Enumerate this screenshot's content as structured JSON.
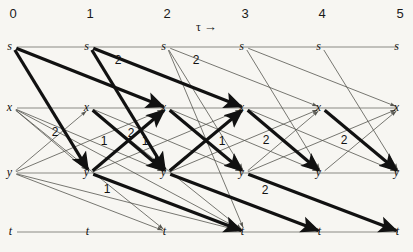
{
  "figure": {
    "kind": "trellis-diagram",
    "background": "#f7f6f2",
    "ink": "#111111",
    "thin_ink": "#55554f",
    "rail_ink": "#8a8a84",
    "width": 413,
    "height": 252
  },
  "axis": {
    "label": "τ",
    "arrow": "→",
    "ticks": [
      {
        "text": "0",
        "x": 13
      },
      {
        "text": "1",
        "x": 90
      },
      {
        "text": "2",
        "x": 167
      },
      {
        "text": "3",
        "x": 245
      },
      {
        "text": "4",
        "x": 322
      },
      {
        "text": "5",
        "x": 400
      }
    ],
    "tick_y": 14
  },
  "rows": [
    {
      "name": "s",
      "label": "s",
      "y": 47
    },
    {
      "name": "x",
      "label": "x",
      "y": 108
    },
    {
      "name": "y",
      "label": "y",
      "y": 173
    },
    {
      "name": "t",
      "label": "t",
      "y": 232
    }
  ],
  "columns": [
    13,
    90,
    167,
    245,
    322,
    400
  ],
  "nodes": [
    {
      "id": "s0",
      "row": "s",
      "col": 0,
      "label": "s"
    },
    {
      "id": "s1",
      "row": "s",
      "col": 1,
      "label": "s"
    },
    {
      "id": "s2",
      "row": "s",
      "col": 2,
      "label": "s"
    },
    {
      "id": "s3",
      "row": "s",
      "col": 3,
      "label": "s"
    },
    {
      "id": "s4",
      "row": "s",
      "col": 4,
      "label": "s"
    },
    {
      "id": "s5",
      "row": "s",
      "col": 5,
      "label": "s"
    },
    {
      "id": "x0",
      "row": "x",
      "col": 0,
      "label": "x"
    },
    {
      "id": "x1",
      "row": "x",
      "col": 1,
      "label": "x"
    },
    {
      "id": "x2",
      "row": "x",
      "col": 2,
      "label": "x"
    },
    {
      "id": "x3",
      "row": "x",
      "col": 3,
      "label": "x"
    },
    {
      "id": "x4",
      "row": "x",
      "col": 4,
      "label": "x"
    },
    {
      "id": "x5",
      "row": "x",
      "col": 5,
      "label": "x"
    },
    {
      "id": "y0",
      "row": "y",
      "col": 0,
      "label": "y"
    },
    {
      "id": "y1",
      "row": "y",
      "col": 1,
      "label": "y"
    },
    {
      "id": "y2",
      "row": "y",
      "col": 2,
      "label": "y"
    },
    {
      "id": "y3",
      "row": "y",
      "col": 3,
      "label": "y"
    },
    {
      "id": "y4",
      "row": "y",
      "col": 4,
      "label": "y"
    },
    {
      "id": "y5",
      "row": "y",
      "col": 5,
      "label": "y"
    },
    {
      "id": "t0",
      "row": "t",
      "col": 0,
      "label": "t"
    },
    {
      "id": "t1",
      "row": "t",
      "col": 1,
      "label": "t"
    },
    {
      "id": "t2",
      "row": "t",
      "col": 2,
      "label": "t"
    },
    {
      "id": "t3",
      "row": "t",
      "col": 3,
      "label": "t"
    },
    {
      "id": "t4",
      "row": "t",
      "col": 4,
      "label": "t"
    },
    {
      "id": "t5",
      "row": "t",
      "col": 5,
      "label": "t"
    }
  ],
  "rails": [
    {
      "row": "s",
      "from": 0,
      "to": 5
    },
    {
      "row": "x",
      "from": 0,
      "to": 5
    },
    {
      "row": "y",
      "from": 0,
      "to": 5
    },
    {
      "row": "t",
      "from": 0,
      "to": 5
    }
  ],
  "thin_edges": [
    {
      "from": "x0",
      "to": "y1"
    },
    {
      "from": "x0",
      "to": "y2"
    },
    {
      "from": "x0",
      "to": "t2"
    },
    {
      "from": "x0",
      "to": "t3"
    },
    {
      "from": "y0",
      "to": "x1"
    },
    {
      "from": "y0",
      "to": "x2"
    },
    {
      "from": "y0",
      "to": "t2"
    },
    {
      "from": "y0",
      "to": "t3"
    },
    {
      "from": "s1",
      "to": "y2"
    },
    {
      "from": "x1",
      "to": "y2"
    },
    {
      "from": "x1",
      "to": "y3"
    },
    {
      "from": "x1",
      "to": "t3"
    },
    {
      "from": "y1",
      "to": "x2"
    },
    {
      "from": "y1",
      "to": "x3"
    },
    {
      "from": "y1",
      "to": "t3"
    },
    {
      "from": "s2",
      "to": "y3"
    },
    {
      "from": "s2",
      "to": "x4"
    },
    {
      "from": "s2",
      "to": "t3"
    },
    {
      "from": "x2",
      "to": "y3"
    },
    {
      "from": "x2",
      "to": "y4"
    },
    {
      "from": "y2",
      "to": "x3"
    },
    {
      "from": "y2",
      "to": "x4"
    },
    {
      "from": "s3",
      "to": "y4"
    },
    {
      "from": "s3",
      "to": "x5"
    },
    {
      "from": "x3",
      "to": "y4"
    },
    {
      "from": "x3",
      "to": "y5"
    },
    {
      "from": "y3",
      "to": "x4"
    },
    {
      "from": "y3",
      "to": "x5"
    },
    {
      "from": "s4",
      "to": "y5"
    },
    {
      "from": "x4",
      "to": "y5"
    },
    {
      "from": "y4",
      "to": "x5"
    }
  ],
  "bold_edges": [
    {
      "from": "s0",
      "to": "y1",
      "label": "2",
      "label_x": 55,
      "label_y": 132
    },
    {
      "from": "s0",
      "to": "x2",
      "label": "2",
      "label_x": 118,
      "label_y": 60
    },
    {
      "from": "s1",
      "to": "y2",
      "label": "2",
      "label_x": 131,
      "label_y": 133
    },
    {
      "from": "s1",
      "to": "x3",
      "label": "2",
      "label_x": 196,
      "label_y": 60
    },
    {
      "from": "y1",
      "to": "x2",
      "label": "1",
      "label_x": 104,
      "label_y": 141
    },
    {
      "from": "x1",
      "to": "y2",
      "label": "1",
      "label_x": 145,
      "label_y": 141
    },
    {
      "from": "y1",
      "to": "t3",
      "label": "1",
      "label_x": 107,
      "label_y": 189
    },
    {
      "from": "x2",
      "to": "y3",
      "label": "1",
      "label_x": 222,
      "label_y": 141
    },
    {
      "from": "y2",
      "to": "x3",
      "label": "",
      "label_x": 0,
      "label_y": 0
    },
    {
      "from": "x3",
      "to": "y4",
      "label": "2",
      "label_x": 266,
      "label_y": 140
    },
    {
      "from": "x4",
      "to": "y5",
      "label": "2",
      "label_x": 344,
      "label_y": 140
    },
    {
      "from": "y2",
      "to": "t4",
      "label": "",
      "label_x": 0,
      "label_y": 0
    },
    {
      "from": "y3",
      "to": "t5",
      "label": "2",
      "label_x": 265,
      "label_y": 190
    }
  ],
  "bold_edge_labels": [
    {
      "text": "2",
      "x": 55,
      "y": 132
    },
    {
      "text": "2",
      "x": 118,
      "y": 60
    },
    {
      "text": "2",
      "x": 131,
      "y": 133
    },
    {
      "text": "2",
      "x": 196,
      "y": 60
    },
    {
      "text": "1",
      "x": 104,
      "y": 141
    },
    {
      "text": "1",
      "x": 145,
      "y": 141
    },
    {
      "text": "1",
      "x": 107,
      "y": 189
    },
    {
      "text": "1",
      "x": 222,
      "y": 141
    },
    {
      "text": "2",
      "x": 266,
      "y": 140
    },
    {
      "text": "2",
      "x": 344,
      "y": 140
    },
    {
      "text": "2",
      "x": 265,
      "y": 190
    }
  ]
}
